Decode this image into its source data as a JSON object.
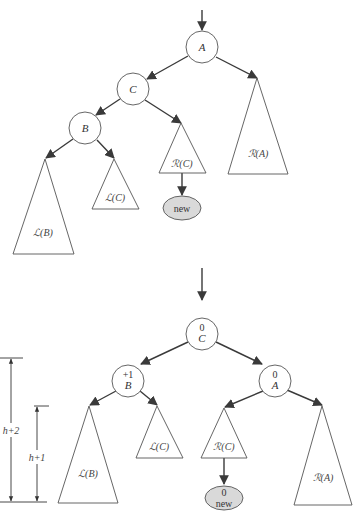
{
  "colors": {
    "line": "#3a3a3a",
    "outline": "#555555",
    "new_fill": "#d9d9d9",
    "background": "#ffffff"
  },
  "top_tree": {
    "nodes": {
      "A": {
        "label": "A"
      },
      "C": {
        "label": "C"
      },
      "B": {
        "label": "B"
      },
      "new": {
        "label": "new"
      }
    },
    "subtrees": {
      "RA": "ℛ(A)",
      "RC": "ℛ(C)",
      "LC": "ℒ(C)",
      "LB": "ℒ(B)"
    }
  },
  "bottom_tree": {
    "nodes": {
      "C": {
        "label": "C",
        "balance": "0"
      },
      "B": {
        "label": "B",
        "balance": "+1"
      },
      "A": {
        "label": "A",
        "balance": "0"
      },
      "new": {
        "label": "new",
        "balance": "0"
      }
    },
    "subtrees": {
      "LB": "ℒ(B)",
      "LC": "ℒ(C)",
      "RC": "ℛ(C)",
      "RA": "ℛ(A)"
    },
    "dimensions": {
      "outer": "h+2",
      "inner": "h+1"
    }
  }
}
